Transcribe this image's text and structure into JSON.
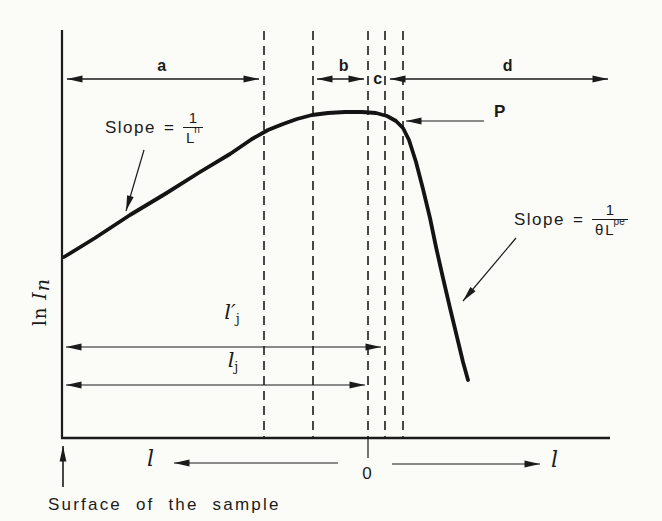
{
  "labels": {
    "region_a": "a",
    "region_b": "b",
    "region_c": "c",
    "region_d": "d",
    "point_p": "P",
    "zero": "0",
    "axis_l_left": "l",
    "axis_l_right": "l",
    "y_axis_ln": "ln",
    "y_axis_symbol": "I",
    "y_axis_sub": "n",
    "caption": "Surface of the sample",
    "slope_left": {
      "word": "Slope",
      "eq": "=",
      "num": "1",
      "den_base": "L",
      "den_sub": "n"
    },
    "slope_right": {
      "word": "Slope",
      "eq": "=",
      "num": "1",
      "den_theta": "θ",
      "den_base": "L",
      "den_sub": "pe"
    },
    "l_prime_j": {
      "base": "l",
      "prime": "′",
      "sub": "j"
    },
    "l_j": {
      "base": "l",
      "sub": "j"
    }
  },
  "chart_data": {
    "type": "line",
    "title": "",
    "ylabel": "ln In",
    "xlabel_left": "l",
    "xlabel_right": "l",
    "x_origin_label": "0",
    "legend": "none",
    "grid": "off",
    "axes_px": {
      "y_axis_x": 62,
      "y_axis_top": 30,
      "x_axis_y": 438,
      "x_axis_right": 610
    },
    "dashed_boundaries_x_px": [
      264,
      313,
      368,
      385,
      403
    ],
    "regions": [
      {
        "label": "a",
        "from_px": 62,
        "to_px": 264
      },
      {
        "label": "b",
        "from_px": 313,
        "to_px": 368
      },
      {
        "label": "c",
        "from_px": 368,
        "to_px": 385
      },
      {
        "label": "d",
        "from_px": 385,
        "to_px": 610
      }
    ],
    "annotations": [
      {
        "text": "Slope = 1/Ln",
        "points_to_px": [
          126,
          213
        ]
      },
      {
        "text": "Slope = 1/(θ Lpe)",
        "points_to_px": [
          462,
          303
        ]
      },
      {
        "text": "P",
        "points_to_px": [
          404,
          121
        ]
      },
      {
        "text": "l′j span",
        "from_px": 64,
        "to_px": 382,
        "y_px": 347
      },
      {
        "text": "lj span",
        "from_px": 64,
        "to_px": 366,
        "y_px": 385
      },
      {
        "text": "Surface of the sample",
        "points_to_px": [
          63,
          441
        ]
      }
    ],
    "curve_points_px": [
      [
        64,
        257
      ],
      [
        95,
        238
      ],
      [
        130,
        215
      ],
      [
        165,
        194
      ],
      [
        200,
        172
      ],
      [
        230,
        154
      ],
      [
        252,
        139
      ],
      [
        268,
        130
      ],
      [
        283,
        124
      ],
      [
        297,
        119
      ],
      [
        312,
        115
      ],
      [
        328,
        113
      ],
      [
        345,
        112
      ],
      [
        362,
        112
      ],
      [
        376,
        113
      ],
      [
        387,
        116
      ],
      [
        396,
        121
      ],
      [
        403,
        128
      ],
      [
        409,
        140
      ],
      [
        416,
        162
      ],
      [
        423,
        189
      ],
      [
        430,
        218
      ],
      [
        436,
        247
      ],
      [
        443,
        278
      ],
      [
        450,
        308
      ],
      [
        457,
        337
      ],
      [
        463,
        362
      ],
      [
        468,
        380
      ]
    ]
  }
}
